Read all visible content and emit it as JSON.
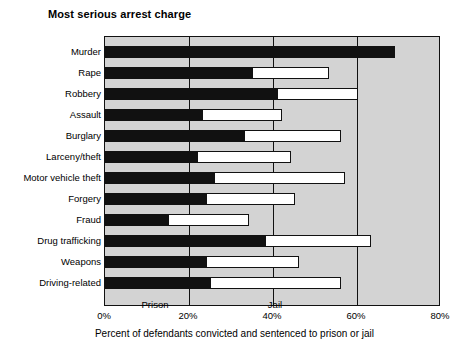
{
  "chart_data": {
    "type": "bar",
    "orientation": "horizontal",
    "stacked": true,
    "title": "Most serious arrest charge",
    "xlabel": "Percent of defendants convicted and sentenced to prison or jail",
    "ylabel": "",
    "xlim": [
      0,
      80
    ],
    "grid": true,
    "legend_position": "inside-bottom",
    "categories": [
      "Murder",
      "Rape",
      "Robbery",
      "Assault",
      "Burglary",
      "Larceny/theft",
      "Motor vehicle theft",
      "Forgery",
      "Fraud",
      "Drug trafficking",
      "Weapons",
      "Driving-related"
    ],
    "tick_labels": [
      "0%",
      "20%",
      "40%",
      "60%",
      "80%"
    ],
    "tick_values": [
      0,
      20,
      40,
      60,
      80
    ],
    "series": [
      {
        "name": "Prison",
        "color": "#111111",
        "values": [
          69,
          35,
          41,
          23,
          33,
          22,
          26,
          24,
          15,
          38,
          24,
          25
        ]
      },
      {
        "name": "Jail",
        "color": "#ffffff",
        "values": [
          0,
          18,
          19,
          19,
          23,
          22,
          31,
          21,
          19,
          25,
          22,
          31
        ]
      }
    ],
    "totals": [
      69,
      53,
      60,
      42,
      56,
      44,
      57,
      45,
      34,
      63,
      46,
      56
    ],
    "legend": [
      {
        "label": "Prison",
        "color": "#111111"
      },
      {
        "label": "Jail",
        "color": "#ffffff"
      }
    ],
    "colors": {
      "plot_background": "#d3d3d3",
      "prison": "#111111",
      "jail": "#ffffff",
      "frame": "#111111"
    }
  }
}
